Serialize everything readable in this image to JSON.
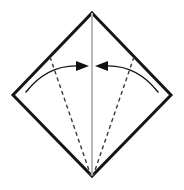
{
  "diagram": {
    "title": "Origami fold step: fold both lower side edges to the vertical center crease",
    "canvas": {
      "width": 184,
      "height": 190,
      "background": "#ffffff"
    },
    "colors": {
      "outline": "#161616",
      "crease_center": "#b9b9b9",
      "fold_line_dashed": "#3a3a3a",
      "arrow": "#111111",
      "background": "#ffffff"
    },
    "shape": {
      "name": "square-rotated-45-diamond",
      "stroke_width": 3,
      "vertices": {
        "top": {
          "x": 92,
          "y": 13
        },
        "right": {
          "x": 171,
          "y": 95
        },
        "bottom": {
          "x": 92,
          "y": 176
        },
        "left": {
          "x": 13,
          "y": 95
        }
      },
      "points_path": "92,13 171,95 92,176 13,95"
    },
    "center_crease": {
      "name": "vertical-center-crease",
      "type": "existing-crease",
      "stroke_width": 2,
      "from": {
        "x": 92,
        "y": 13
      },
      "to": {
        "x": 92,
        "y": 176
      }
    },
    "fold_lines": [
      {
        "name": "left-valley-fold-line",
        "style": "dashed",
        "stroke_width": 1.4,
        "dash_pattern": "4,3.2",
        "from": {
          "x": 50,
          "y": 57
        },
        "to": {
          "x": 91,
          "y": 176
        }
      },
      {
        "name": "right-valley-fold-line",
        "style": "dashed",
        "stroke_width": 1.4,
        "dash_pattern": "4,3.2",
        "from": {
          "x": 134,
          "y": 57
        },
        "to": {
          "x": 93,
          "y": 176
        }
      }
    ],
    "arrows": [
      {
        "name": "left-fold-arrow",
        "direction": "right",
        "meaning": "fold left edge inward to center crease",
        "stroke_width": 1.4,
        "path": "M 26,92 Q 48,64 80,66",
        "head": {
          "tip": {
            "x": 89,
            "y": 66
          },
          "back_top": {
            "x": 76,
            "y": 61
          },
          "back_bottom": {
            "x": 76,
            "y": 71
          }
        }
      },
      {
        "name": "right-fold-arrow",
        "direction": "left",
        "meaning": "fold right edge inward to center crease",
        "stroke_width": 1.4,
        "path": "M 158,92 Q 136,64 104,66",
        "head": {
          "tip": {
            "x": 95,
            "y": 66
          },
          "back_top": {
            "x": 108,
            "y": 61
          },
          "back_bottom": {
            "x": 108,
            "y": 71
          }
        }
      }
    ]
  }
}
